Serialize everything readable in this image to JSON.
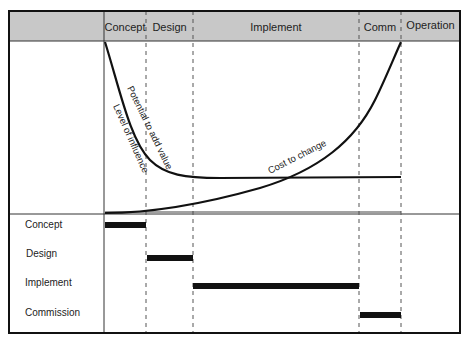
{
  "header": {
    "phases": [
      {
        "label": "Concept",
        "x1": 104,
        "x2": 146
      },
      {
        "label": "Design",
        "x1": 146,
        "x2": 193
      },
      {
        "label": "Implement",
        "x1": 193,
        "x2": 359
      },
      {
        "label": "Comm",
        "x1": 359,
        "x2": 401
      },
      {
        "label": "Operation",
        "x1": 401,
        "x2": 460
      }
    ]
  },
  "curves": {
    "potential": "Potential to add value",
    "influence": "Level of influence",
    "cost": "Cost to change"
  },
  "schedule": {
    "rows": [
      {
        "label": "Concept",
        "y": 225,
        "x1": 105,
        "x2": 146
      },
      {
        "label": "Design",
        "y": 258,
        "x1": 147,
        "x2": 193
      },
      {
        "label": "Implement",
        "y": 286,
        "x1": 193,
        "x2": 359
      },
      {
        "label": "Commission",
        "y": 315,
        "x1": 360,
        "x2": 401
      }
    ]
  },
  "colors": {
    "header_bg": "#c8c8c8",
    "line": "#111111",
    "dash": "#555555"
  }
}
